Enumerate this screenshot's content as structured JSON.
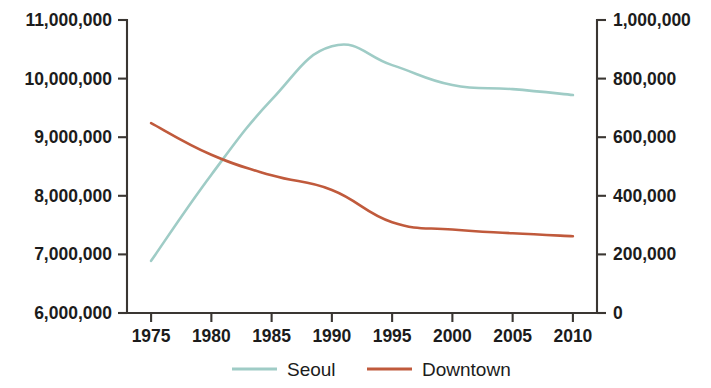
{
  "chart_data": {
    "type": "line",
    "title": "",
    "subtitle": "",
    "xlabel": "",
    "ylabel": "",
    "y2label": "",
    "grid": false,
    "legend_position": "bottom",
    "x": [
      1975,
      1980,
      1985,
      1990,
      1995,
      2000,
      2005,
      2010
    ],
    "xlim": [
      1973,
      2012
    ],
    "xticks": [
      "1975",
      "1980",
      "1985",
      "1990",
      "1995",
      "2000",
      "2005",
      "2010"
    ],
    "ylim": [
      6000000,
      11000000
    ],
    "yticks": [
      "6,000,000",
      "7,000,000",
      "8,000,000",
      "9,000,000",
      "10,000,000",
      "11,000,000"
    ],
    "ytick_values": [
      6000000,
      7000000,
      8000000,
      9000000,
      10000000,
      11000000
    ],
    "y2lim": [
      0,
      1000000
    ],
    "y2ticks": [
      "0",
      "200,000",
      "400,000",
      "600,000",
      "800,000",
      "1,000,000"
    ],
    "y2tick_values": [
      0,
      200000,
      400000,
      600000,
      800000,
      1000000
    ],
    "series": [
      {
        "name": "Seoul",
        "axis": "left",
        "color": "#9fccc6",
        "x": [
          1975,
          1980,
          1985,
          1990,
          1995,
          2000,
          2005,
          2010
        ],
        "values": [
          6890000,
          8360000,
          9640000,
          10550000,
          10230000,
          9890000,
          9820000,
          9720000
        ]
      },
      {
        "name": "Downtown",
        "axis": "right",
        "color": "#c05a3c",
        "x": [
          1975,
          1980,
          1985,
          1990,
          1995,
          2000,
          2005,
          2010
        ],
        "values": [
          648000,
          540000,
          470000,
          420000,
          310000,
          285000,
          272000,
          262000
        ]
      }
    ]
  },
  "legend": {
    "items": [
      {
        "label": "Seoul",
        "color": "#9fccc6"
      },
      {
        "label": "Downtown",
        "color": "#c05a3c"
      }
    ]
  }
}
